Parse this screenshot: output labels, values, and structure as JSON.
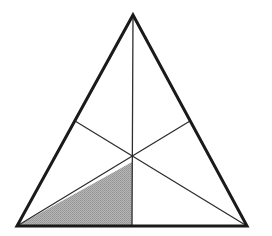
{
  "figure": {
    "background_color": "#ffffff",
    "canvas": {
      "width": 272,
      "height": 236
    }
  },
  "style": {
    "outline_color": "#1a1a1a",
    "outline_width": 3.0,
    "median_color": "#2e2e2e",
    "median_width": 1.3,
    "shade_fill": "#a9a9a9",
    "shade_dither_light": "#c9c9c9",
    "shade_dither_dark": "#8e8e8e",
    "shade_edge_color": "#4a4a4a"
  },
  "chart_data": {
    "type": "diagram",
    "shape": "triangle",
    "vertices": [
      {
        "name": "apex",
        "label": "A",
        "x": 133,
        "y": 15
      },
      {
        "name": "bottom-left",
        "label": "B",
        "x": 17,
        "y": 226
      },
      {
        "name": "bottom-right",
        "label": "C",
        "x": 247,
        "y": 226
      }
    ],
    "midpoints": [
      {
        "name": "midpoint-left-side",
        "label": "M_AB",
        "x": 75,
        "y": 121
      },
      {
        "name": "midpoint-right-side",
        "label": "M_AC",
        "x": 190,
        "y": 121
      },
      {
        "name": "midpoint-base",
        "label": "M_BC",
        "x": 132,
        "y": 226
      }
    ],
    "centroid": {
      "name": "centroid",
      "label": "G",
      "x": 132,
      "y": 162
    },
    "medians": [
      {
        "name": "median-apex-to-base",
        "from": "apex",
        "to": "midpoint-base",
        "x1": 133,
        "y1": 15,
        "x2": 132,
        "y2": 226
      },
      {
        "name": "median-left-to-right-side",
        "from": "bottom-left",
        "to": "midpoint-right-side",
        "x1": 17,
        "y1": 226,
        "x2": 190,
        "y2": 121
      },
      {
        "name": "median-right-to-left-side",
        "from": "bottom-right",
        "to": "midpoint-left-side",
        "x1": 247,
        "y1": 226,
        "x2": 75,
        "y2": 121
      }
    ],
    "shaded_region": {
      "name": "shaded-sub-triangle",
      "points": [
        {
          "x": 17,
          "y": 226
        },
        {
          "x": 132,
          "y": 162
        },
        {
          "x": 132,
          "y": 226
        }
      ],
      "fill": "#a9a9a9",
      "pattern": "dithered-halftone",
      "area_fraction": "1/6"
    },
    "sub_triangle_count": 6,
    "labels": [],
    "annotations": []
  }
}
